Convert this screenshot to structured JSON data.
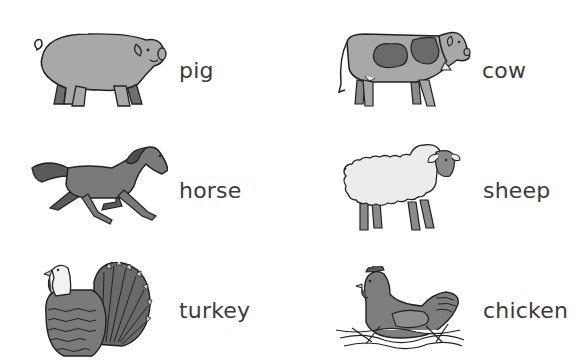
{
  "worksheet": {
    "items": [
      {
        "name": "pig",
        "label": "pig",
        "position": "row1-left"
      },
      {
        "name": "cow",
        "label": "cow",
        "position": "row1-right"
      },
      {
        "name": "horse",
        "label": "horse",
        "position": "row2-left"
      },
      {
        "name": "sheep",
        "label": "sheep",
        "position": "row2-right"
      },
      {
        "name": "turkey",
        "label": "turkey",
        "position": "row3-left"
      },
      {
        "name": "chicken",
        "label": "chicken",
        "position": "row3-right"
      }
    ]
  },
  "colors": {
    "outline": "#222222",
    "body_gray": "#a8a8a8",
    "dark_gray": "#6e6e6e",
    "light_fill": "#ececec",
    "text": "#3a3a3a",
    "background": "#ffffff"
  }
}
